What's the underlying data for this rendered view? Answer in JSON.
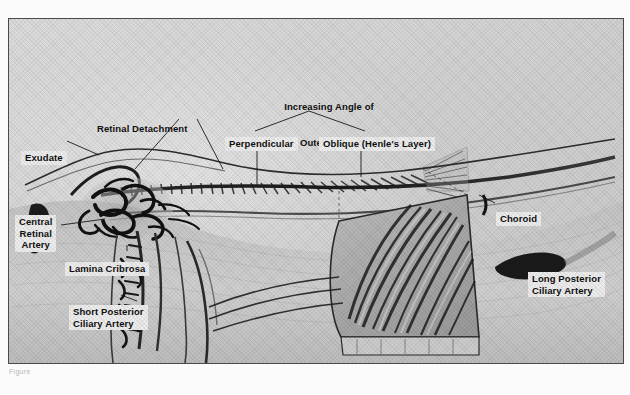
{
  "figure": {
    "title_line_1": "Increasing Angle of",
    "title_line_2": "Fibers in Outer Plexiform Layer",
    "caption": "Figure"
  },
  "labels": {
    "perpendicular": "Perpendicular",
    "oblique": "Oblique (Henle's Layer)",
    "retinal_detachment": "Retinal Detachment",
    "exudate": "Exudate",
    "central_retinal_artery": "Central\nRetinal\nArtery",
    "lamina_cribrosa": "Lamina Cribrosa",
    "short_posterior_ciliary_artery": "Short Posterior\nCiliary Artery",
    "choroid": "Choroid",
    "long_posterior_ciliary_artery": "Long Posterior\nCiliary Artery"
  },
  "colors": {
    "plate_background": "#d2d2d2",
    "frame_border": "#4a4a4a",
    "ink": "#101010",
    "label_background": "#ececec"
  }
}
